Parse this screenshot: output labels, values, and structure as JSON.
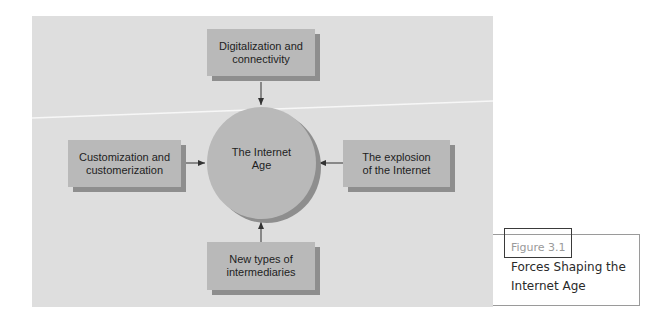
{
  "diagram": {
    "center": {
      "label": "The Internet Age"
    },
    "forces": {
      "top": {
        "label": "Digitalization and connectivity"
      },
      "left": {
        "label": "Customization and customerization"
      },
      "right": {
        "label": "The explosion of the Internet"
      },
      "bottom": {
        "label": "New types of intermediaries"
      }
    },
    "colors": {
      "panel_background": "#dedede",
      "node_fill": "#b9b9b9",
      "node_shadow": "#8e8e8e",
      "arrow": "#333333"
    }
  },
  "caption": {
    "label": "Figure 3.1",
    "title": "Forces Shaping the Internet Age"
  }
}
